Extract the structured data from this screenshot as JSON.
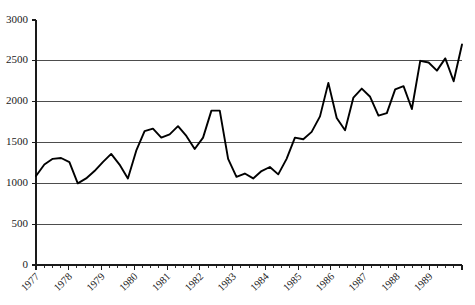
{
  "chart_data": {
    "type": "line",
    "title": "",
    "subtitle": "",
    "xlabel": "",
    "ylabel": "",
    "ylim": [
      0,
      3000
    ],
    "ytick_labels": [
      "0",
      "500",
      "1000",
      "1500",
      "2000",
      "2500",
      "3000"
    ],
    "ytick_values": [
      0,
      500,
      1000,
      1500,
      2000,
      2500,
      3000
    ],
    "gridlines_at": [
      500,
      1000,
      1500,
      2000,
      2500
    ],
    "grid": true,
    "legend": "none",
    "xtick_labels": [
      "1977",
      "1978",
      "1979",
      "1980",
      "1981",
      "1982",
      "1983",
      "1984",
      "1985",
      "1986",
      "1987",
      "1988",
      "1989"
    ],
    "minor_ticks_per_interval": 3,
    "x_period": "quarterly",
    "x": [
      "1977 Q1",
      "1977 Q2",
      "1977 Q3",
      "1977 Q4",
      "1978 Q1",
      "1978 Q2",
      "1978 Q3",
      "1978 Q4",
      "1979 Q1",
      "1979 Q2",
      "1979 Q3",
      "1979 Q4",
      "1980 Q1",
      "1980 Q2",
      "1980 Q3",
      "1980 Q4",
      "1981 Q1",
      "1981 Q2",
      "1981 Q3",
      "1981 Q4",
      "1982 Q1",
      "1982 Q2",
      "1982 Q3",
      "1982 Q4",
      "1983 Q1",
      "1983 Q2",
      "1983 Q3",
      "1983 Q4",
      "1984 Q1",
      "1984 Q2",
      "1984 Q3",
      "1984 Q4",
      "1985 Q1",
      "1985 Q2",
      "1985 Q3",
      "1985 Q4",
      "1986 Q1",
      "1986 Q2",
      "1986 Q3",
      "1986 Q4",
      "1987 Q1",
      "1987 Q2",
      "1987 Q3",
      "1987 Q4",
      "1988 Q1",
      "1988 Q2",
      "1988 Q3",
      "1988 Q4",
      "1989 Q1",
      "1989 Q2",
      "1989 Q3",
      "1989 Q4"
    ],
    "series": [
      {
        "name": "series-1",
        "values": [
          1090,
          1230,
          1300,
          1310,
          1260,
          1000,
          1060,
          1150,
          1260,
          1360,
          1230,
          1060,
          1400,
          1640,
          1670,
          1560,
          1600,
          1700,
          1580,
          1420,
          1560,
          1890,
          1890,
          1300,
          1080,
          1120,
          1060,
          1150,
          1200,
          1110,
          1300,
          1560,
          1540,
          1630,
          1820,
          2230,
          1800,
          1650,
          2050,
          2160,
          2060,
          1830,
          1860,
          2150,
          2190,
          1910,
          2500,
          2480,
          2380,
          2530,
          2250,
          2700
        ]
      }
    ]
  },
  "plot": {
    "x_start_px": 36,
    "x_end_px": 462,
    "y_zero_px": 265,
    "y_top_px": 20,
    "y_max_value": 3000
  }
}
